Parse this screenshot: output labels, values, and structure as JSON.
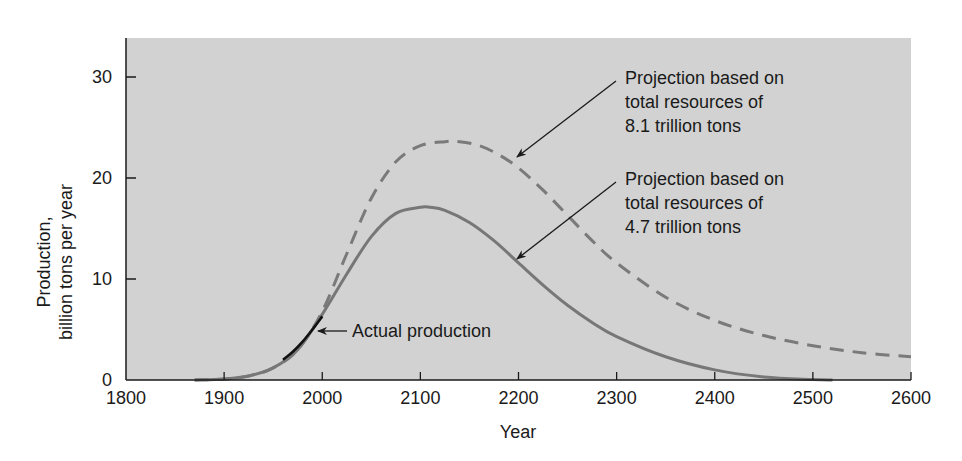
{
  "chart_data": {
    "type": "line",
    "title": "",
    "xlabel": "Year",
    "ylabel": [
      "Production,",
      "billion tons per year"
    ],
    "xlim": [
      1800,
      2600
    ],
    "ylim": [
      0,
      34
    ],
    "xticks": [
      1800,
      1900,
      2000,
      2100,
      2200,
      2300,
      2400,
      2500,
      2600
    ],
    "yticks": [
      0,
      10,
      20,
      30
    ],
    "grid": false,
    "legend": "none (inline annotations)",
    "background_color": "#d2d2d2",
    "series": [
      {
        "name": "Projection based on total resources of 8.1 trillion tons",
        "style": "dashed",
        "color": "#7a7a7a",
        "x": [
          1870,
          1900,
          1925,
          1950,
          1975,
          2000,
          2025,
          2050,
          2075,
          2100,
          2125,
          2140,
          2160,
          2180,
          2200,
          2225,
          2250,
          2275,
          2300,
          2350,
          2400,
          2450,
          2500,
          2550,
          2600
        ],
        "values": [
          0,
          0.1,
          0.4,
          1.2,
          3.0,
          6.8,
          12.5,
          18.0,
          21.6,
          23.2,
          23.6,
          23.6,
          23.2,
          22.3,
          21.0,
          18.8,
          16.3,
          13.8,
          11.6,
          8.2,
          5.9,
          4.4,
          3.4,
          2.7,
          2.3
        ]
      },
      {
        "name": "Projection based on total resources of 4.7 trillion tons",
        "style": "solid",
        "color": "#777777",
        "x": [
          1870,
          1900,
          1925,
          1950,
          1975,
          2000,
          2025,
          2050,
          2075,
          2100,
          2110,
          2125,
          2150,
          2175,
          2200,
          2225,
          2250,
          2275,
          2300,
          2350,
          2400,
          2450,
          2500,
          2520
        ],
        "values": [
          0,
          0.1,
          0.4,
          1.2,
          3.0,
          6.5,
          10.5,
          14.2,
          16.5,
          17.1,
          17.1,
          16.8,
          15.6,
          13.8,
          11.6,
          9.4,
          7.4,
          5.7,
          4.3,
          2.3,
          1.0,
          0.3,
          0.05,
          0
        ]
      },
      {
        "name": "Actual production",
        "style": "solid",
        "color": "#111111",
        "x": [
          1960,
          1970,
          1980,
          1990,
          2000
        ],
        "values": [
          2.0,
          2.8,
          3.8,
          5.0,
          6.3
        ]
      }
    ],
    "annotations": [
      {
        "lines": [
          "Projection based on",
          "total resources of",
          "8.1 trillion tons"
        ],
        "points_to": "dashed curve near 2190"
      },
      {
        "lines": [
          "Projection based on",
          "total resources of",
          "4.7 trillion tons"
        ],
        "points_to": "solid curve near 2195"
      },
      {
        "lines": [
          "Actual production"
        ],
        "points_to": "black segment near 1990"
      }
    ]
  }
}
